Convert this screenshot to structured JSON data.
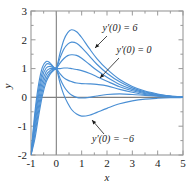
{
  "chart_data": {
    "type": "line",
    "title": "",
    "xlabel": "x",
    "ylabel": "y",
    "xlim": [
      -1,
      5
    ],
    "ylim": [
      -2,
      3
    ],
    "xticks": [
      -1,
      0,
      1,
      2,
      3,
      4,
      5
    ],
    "yticks": [
      -2,
      -1,
      0,
      1,
      2,
      3
    ],
    "xtick_labels": [
      "-1",
      "0",
      "1",
      "2",
      "3",
      "4",
      "5"
    ],
    "ytick_labels": [
      "-2",
      "-1",
      "0",
      "1",
      "2",
      "3"
    ],
    "minor_tick_step": 0.5,
    "grid": false,
    "legend": "none",
    "curve_color": "#4a8fd4",
    "axis_color": "#808080",
    "frame_color": "#999999",
    "series": [
      {
        "name": "y'(0) = 6",
        "slope0": 6,
        "points": [
          [
            -1,
            -2.0
          ],
          [
            -0.85,
            -0.55
          ],
          [
            -0.7,
            0.45
          ],
          [
            -0.55,
            1.05
          ],
          [
            -0.4,
            1.25
          ],
          [
            -0.25,
            1.2
          ],
          [
            -0.1,
            1.05
          ],
          [
            0,
            1.0
          ],
          [
            0.15,
            1.55
          ],
          [
            0.3,
            2.0
          ],
          [
            0.45,
            2.25
          ],
          [
            0.6,
            2.35
          ],
          [
            0.8,
            2.28
          ],
          [
            1.0,
            2.08
          ],
          [
            1.3,
            1.7
          ],
          [
            1.6,
            1.35
          ],
          [
            2.0,
            0.98
          ],
          [
            2.5,
            0.62
          ],
          [
            3.0,
            0.38
          ],
          [
            3.5,
            0.22
          ],
          [
            4.0,
            0.12
          ],
          [
            4.5,
            0.05
          ],
          [
            5.0,
            0.02
          ]
        ]
      },
      {
        "name": "y'(0) = 4",
        "slope0": 4,
        "points": [
          [
            -1,
            -2.0
          ],
          [
            -0.85,
            -0.7
          ],
          [
            -0.7,
            0.25
          ],
          [
            -0.55,
            0.88
          ],
          [
            -0.4,
            1.15
          ],
          [
            -0.25,
            1.15
          ],
          [
            -0.1,
            1.04
          ],
          [
            0,
            1.0
          ],
          [
            0.15,
            1.38
          ],
          [
            0.3,
            1.68
          ],
          [
            0.45,
            1.85
          ],
          [
            0.6,
            1.92
          ],
          [
            0.8,
            1.88
          ],
          [
            1.0,
            1.73
          ],
          [
            1.3,
            1.44
          ],
          [
            1.6,
            1.15
          ],
          [
            2.0,
            0.84
          ],
          [
            2.5,
            0.54
          ],
          [
            3.0,
            0.33
          ],
          [
            3.5,
            0.19
          ],
          [
            4.0,
            0.1
          ],
          [
            4.5,
            0.045
          ],
          [
            5.0,
            0.018
          ]
        ]
      },
      {
        "name": "y'(0) = 2",
        "slope0": 2,
        "points": [
          [
            -1,
            -2.0
          ],
          [
            -0.85,
            -0.85
          ],
          [
            -0.7,
            0.08
          ],
          [
            -0.55,
            0.72
          ],
          [
            -0.4,
            1.02
          ],
          [
            -0.25,
            1.08
          ],
          [
            -0.1,
            1.02
          ],
          [
            0,
            1.0
          ],
          [
            0.15,
            1.2
          ],
          [
            0.3,
            1.35
          ],
          [
            0.45,
            1.45
          ],
          [
            0.6,
            1.48
          ],
          [
            0.8,
            1.46
          ],
          [
            1.0,
            1.36
          ],
          [
            1.3,
            1.15
          ],
          [
            1.6,
            0.94
          ],
          [
            2.0,
            0.7
          ],
          [
            2.5,
            0.45
          ],
          [
            3.0,
            0.28
          ],
          [
            3.5,
            0.16
          ],
          [
            4.0,
            0.085
          ],
          [
            4.5,
            0.04
          ],
          [
            5.0,
            0.015
          ]
        ]
      },
      {
        "name": "y'(0) = 0",
        "slope0": 0,
        "points": [
          [
            -1,
            -2.0
          ],
          [
            -0.85,
            -1.0
          ],
          [
            -0.7,
            -0.1
          ],
          [
            -0.55,
            0.55
          ],
          [
            -0.4,
            0.9
          ],
          [
            -0.25,
            1.0
          ],
          [
            -0.1,
            1.0
          ],
          [
            0,
            1.0
          ],
          [
            0.15,
            1.0
          ],
          [
            0.3,
            1.02
          ],
          [
            0.45,
            1.02
          ],
          [
            0.6,
            1.0
          ],
          [
            0.8,
            0.97
          ],
          [
            1.0,
            0.93
          ],
          [
            1.3,
            0.84
          ],
          [
            1.6,
            0.72
          ],
          [
            2.0,
            0.56
          ],
          [
            2.5,
            0.37
          ],
          [
            3.0,
            0.23
          ],
          [
            3.5,
            0.13
          ],
          [
            4.0,
            0.07
          ],
          [
            4.5,
            0.032
          ],
          [
            5.0,
            0.012
          ]
        ]
      },
      {
        "name": "y'(0) = -2",
        "slope0": -2,
        "points": [
          [
            -1,
            -2.0
          ],
          [
            -0.85,
            -1.15
          ],
          [
            -0.7,
            -0.3
          ],
          [
            -0.55,
            0.38
          ],
          [
            -0.4,
            0.78
          ],
          [
            -0.25,
            0.93
          ],
          [
            -0.1,
            0.98
          ],
          [
            0,
            1.0
          ],
          [
            0.15,
            0.82
          ],
          [
            0.3,
            0.68
          ],
          [
            0.45,
            0.6
          ],
          [
            0.6,
            0.55
          ],
          [
            0.8,
            0.5
          ],
          [
            1.0,
            0.48
          ],
          [
            1.3,
            0.47
          ],
          [
            1.6,
            0.45
          ],
          [
            2.0,
            0.4
          ],
          [
            2.5,
            0.28
          ],
          [
            3.0,
            0.18
          ],
          [
            3.5,
            0.1
          ],
          [
            4.0,
            0.055
          ],
          [
            4.5,
            0.025
          ],
          [
            5.0,
            0.01
          ]
        ]
      },
      {
        "name": "y'(0) = -4",
        "slope0": -4,
        "points": [
          [
            -1,
            -2.0
          ],
          [
            -0.85,
            -1.3
          ],
          [
            -0.7,
            -0.48
          ],
          [
            -0.55,
            0.22
          ],
          [
            -0.4,
            0.65
          ],
          [
            -0.25,
            0.86
          ],
          [
            -0.1,
            0.96
          ],
          [
            0,
            1.0
          ],
          [
            0.15,
            0.65
          ],
          [
            0.3,
            0.38
          ],
          [
            0.45,
            0.2
          ],
          [
            0.6,
            0.08
          ],
          [
            0.8,
            0.0
          ],
          [
            1.0,
            -0.02
          ],
          [
            1.3,
            0.0
          ],
          [
            1.6,
            0.05
          ],
          [
            2.0,
            0.1
          ],
          [
            2.5,
            0.12
          ],
          [
            3.0,
            0.1
          ],
          [
            3.5,
            0.07
          ],
          [
            4.0,
            0.04
          ],
          [
            4.5,
            0.018
          ],
          [
            5.0,
            0.008
          ]
        ]
      },
      {
        "name": "y'(0) = -6",
        "slope0": -6,
        "points": [
          [
            -1,
            -2.0
          ],
          [
            -0.85,
            -1.45
          ],
          [
            -0.7,
            -0.65
          ],
          [
            -0.55,
            0.06
          ],
          [
            -0.4,
            0.54
          ],
          [
            -0.25,
            0.8
          ],
          [
            -0.1,
            0.94
          ],
          [
            0,
            1.0
          ],
          [
            0.15,
            0.48
          ],
          [
            0.3,
            0.08
          ],
          [
            0.45,
            -0.2
          ],
          [
            0.6,
            -0.42
          ],
          [
            0.8,
            -0.58
          ],
          [
            1.0,
            -0.65
          ],
          [
            1.3,
            -0.62
          ],
          [
            1.6,
            -0.52
          ],
          [
            2.0,
            -0.38
          ],
          [
            2.5,
            -0.22
          ],
          [
            3.0,
            -0.12
          ],
          [
            3.5,
            -0.06
          ],
          [
            4.0,
            -0.03
          ],
          [
            4.5,
            -0.012
          ],
          [
            5.0,
            -0.005
          ]
        ]
      }
    ],
    "annotations": [
      {
        "id": "label-top",
        "text": "y′(0) = 6",
        "text_x": 120,
        "text_y": 31,
        "leader_from": [
          107,
          36
        ],
        "leader_to": [
          95,
          48
        ]
      },
      {
        "id": "label-middle",
        "text": "y′(0) = 0",
        "text_x": 134,
        "text_y": 53,
        "leader_from": [
          119,
          58
        ],
        "leader_to": [
          100,
          78
        ]
      },
      {
        "id": "label-bottom",
        "text": "y′(0) = −6",
        "text_x": 113,
        "text_y": 142,
        "leader_from": [
          104,
          134
        ],
        "leader_to": [
          92,
          120
        ]
      }
    ]
  }
}
